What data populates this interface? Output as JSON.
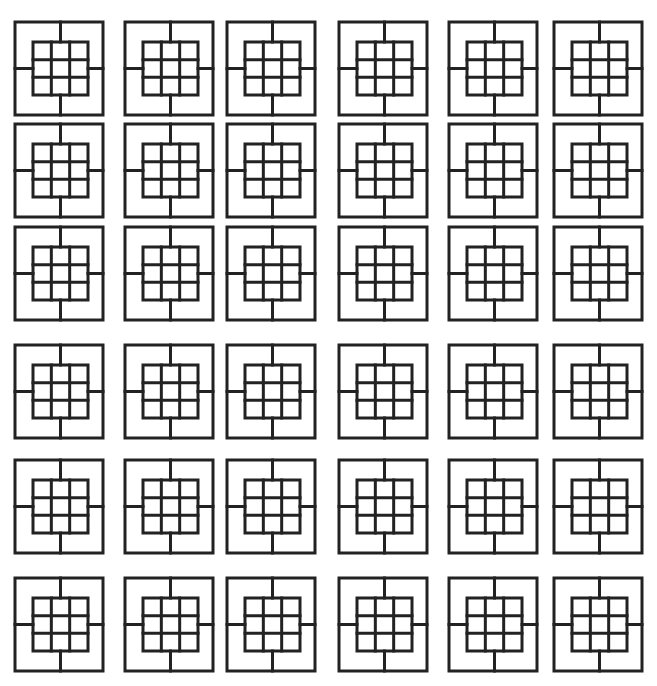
{
  "diagram": {
    "title": "",
    "rows": 6,
    "columns": 6,
    "tile": {
      "shape": "square-with-3x3-inner-grid",
      "inner_grid_rows": 3,
      "inner_grid_columns": 3,
      "connectors": [
        "top",
        "right",
        "bottom",
        "left"
      ]
    },
    "colors": {
      "stroke": "#222222",
      "background": "#ffffff"
    }
  }
}
